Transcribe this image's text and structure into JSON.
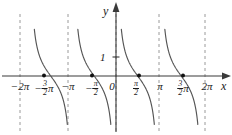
{
  "figure": {
    "kind": "cartesian-plot",
    "width": 232,
    "height": 135,
    "background": "#ffffff"
  },
  "axes": {
    "x_name": "x",
    "y_name": "y",
    "x_axis_y_px": 76,
    "y_axis_x_px": 116,
    "colors": {
      "axis": "#3a3a3a",
      "curve": "#555555",
      "asymptote": "#9a9a9a",
      "marker": "#111111",
      "text": "#1a1a1a"
    }
  },
  "y_ticks": [
    {
      "label": "1",
      "value": 1,
      "y_px": 57
    }
  ],
  "x_ticks": [
    {
      "id": "neg-2pi",
      "value": -6.2832,
      "x_px": 20,
      "lead": "−2",
      "frac": null,
      "trail": "π"
    },
    {
      "id": "neg-3pi-over-2",
      "value": -4.7124,
      "x_px": 44,
      "lead": "−",
      "frac": {
        "num": "3",
        "den": "2"
      },
      "trail": "π"
    },
    {
      "id": "neg-pi",
      "value": -3.1416,
      "x_px": 68,
      "lead": "−",
      "frac": null,
      "trail": "π"
    },
    {
      "id": "neg-pi-over-2",
      "value": -1.5708,
      "x_px": 92,
      "lead": "−",
      "frac": {
        "num": "π",
        "den": "2"
      },
      "trail": ""
    },
    {
      "id": "zero",
      "value": 0,
      "x_px": 112,
      "lead": "0",
      "frac": null,
      "trail": ""
    },
    {
      "id": "pi-over-2",
      "value": 1.5708,
      "x_px": 136,
      "lead": "",
      "frac": {
        "num": "π",
        "den": "2"
      },
      "trail": ""
    },
    {
      "id": "pi",
      "value": 3.1416,
      "x_px": 160,
      "lead": "",
      "frac": null,
      "trail": "π"
    },
    {
      "id": "3pi-over-2",
      "value": 4.7124,
      "x_px": 183,
      "lead": "",
      "frac": {
        "num": "3",
        "den": "2"
      },
      "trail": "π"
    },
    {
      "id": "2pi",
      "value": 6.2832,
      "x_px": 207,
      "lead": "2",
      "frac": null,
      "trail": "π"
    }
  ],
  "chart_data": {
    "type": "line",
    "title": "",
    "xlabel": "x",
    "ylabel": "y",
    "function": "y = cot(x)",
    "xlim": [
      -7.3,
      7.0
    ],
    "ylim": [
      -2.6,
      2.6
    ],
    "grid": false,
    "legend": null,
    "x_tick_labels": [
      "−2π",
      "−(3/2)π",
      "−π",
      "−π/2",
      "0",
      "π/2",
      "π",
      "(3/2)π",
      "2π"
    ],
    "x_tick_values": [
      -6.2832,
      -4.7124,
      -3.1416,
      -1.5708,
      0,
      1.5708,
      3.1416,
      4.7124,
      6.2832
    ],
    "y_tick_labels": [
      "1"
    ],
    "y_tick_values": [
      1
    ],
    "asymptotes": {
      "orientation": "vertical",
      "style": "dashed",
      "values": [
        -6.2832,
        -3.1416,
        0,
        3.1416,
        6.2832
      ],
      "x_px": [
        20,
        68,
        116,
        159,
        205
      ]
    },
    "zero_markers": {
      "style": "filled-dot",
      "values": [
        -4.7124,
        -1.5708,
        1.5708,
        4.7124
      ],
      "x_px": [
        44,
        92,
        139,
        183
      ],
      "y_value": 0
    },
    "branches": [
      {
        "id": "branch-1",
        "domain": [
          -6.2832,
          -3.1416
        ],
        "x_px_range": [
          20,
          68
        ]
      },
      {
        "id": "branch-2",
        "domain": [
          -3.1416,
          0
        ],
        "x_px_range": [
          68,
          116
        ]
      },
      {
        "id": "branch-3",
        "domain": [
          0,
          3.1416
        ],
        "x_px_range": [
          116,
          159
        ]
      },
      {
        "id": "branch-4",
        "domain": [
          3.1416,
          6.2832
        ],
        "x_px_range": [
          159,
          205
        ]
      }
    ],
    "series": [
      {
        "name": "cot(x)",
        "x": [
          -6.05,
          -5.85,
          -5.6,
          -5.3,
          -5.0,
          -4.71,
          -4.4,
          -4.1,
          -3.8,
          -3.5,
          -3.3,
          -2.95,
          -2.75,
          -2.5,
          -2.2,
          -1.9,
          -1.57,
          -1.25,
          -0.95,
          -0.65,
          -0.4,
          -0.2,
          0.22,
          0.42,
          0.67,
          0.97,
          1.27,
          1.57,
          1.9,
          2.2,
          2.5,
          2.75,
          2.95,
          3.35,
          3.55,
          3.8,
          4.1,
          4.4,
          4.71,
          5.0,
          5.3,
          5.6,
          5.85,
          6.05
        ],
        "y": [
          4.26,
          2.55,
          1.66,
          1.04,
          0.61,
          0.0,
          -0.34,
          -0.69,
          -1.1,
          -1.75,
          -2.5,
          4.92,
          2.55,
          1.47,
          0.8,
          0.36,
          0.0,
          -0.34,
          -0.73,
          -1.33,
          -2.37,
          -4.93,
          4.45,
          2.23,
          1.27,
          0.64,
          0.3,
          0.0,
          -0.36,
          -0.8,
          -1.47,
          -2.55,
          -4.92,
          4.8,
          2.41,
          1.43,
          0.85,
          0.38,
          0.0,
          -0.3,
          -0.61,
          -1.04,
          -1.66,
          -2.55
        ]
      }
    ]
  }
}
